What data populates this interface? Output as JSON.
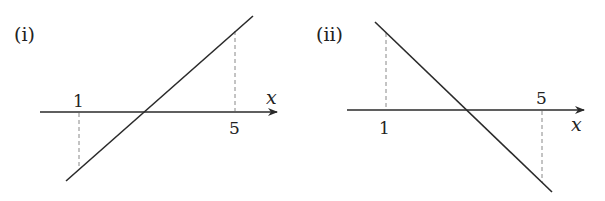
{
  "panels": [
    {
      "label": "(i)",
      "axis_label": "x",
      "ticks": [
        {
          "value": "1",
          "position": "above"
        },
        {
          "value": "5",
          "position": "below"
        }
      ],
      "line": "increasing, negative at x=1, positive at x=5"
    },
    {
      "label": "(ii)",
      "axis_label": "x",
      "ticks": [
        {
          "value": "1",
          "position": "below"
        },
        {
          "value": "5",
          "position": "above"
        }
      ],
      "line": "decreasing, positive at x=1, negative at x=5"
    }
  ],
  "colors": {
    "ink": "#2a2a2a",
    "dashed": "#888888"
  }
}
